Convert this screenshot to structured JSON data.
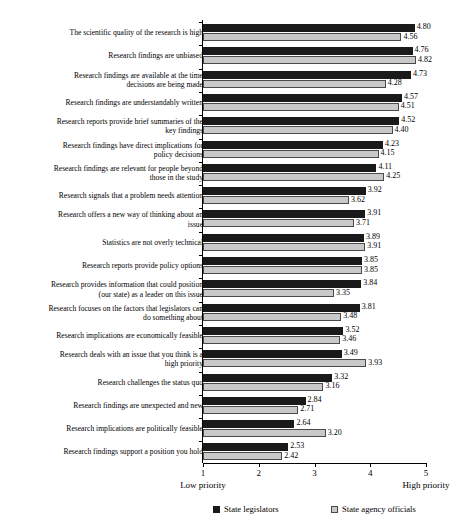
{
  "chart_data": {
    "type": "bar",
    "orientation": "horizontal",
    "title": "",
    "xlabel": "",
    "ylabel": "",
    "xlim": [
      1,
      5
    ],
    "xticks": [
      "1",
      "2",
      "3",
      "4",
      "5"
    ],
    "axis_low_label": "Low\npriority",
    "axis_high_label": "High\npriority",
    "grid": false,
    "legend_position": "bottom",
    "colors": {
      "state_legislators": "#1a1a1a",
      "state_agency_officials": "#c9c9c9",
      "axis": "#000000",
      "background": "#ffffff"
    },
    "categories": [
      "The scientific quality of the research is high",
      "Research findings are unbiased",
      "Research findings are available at the time\ndecisions are being made",
      "Research findings are understandably written",
      "Research reports provide brief summaries of the\nkey findings",
      "Research findings have direct implications for\npolicy decisions",
      "Research findings are relevant for people beyond\nthose in the study",
      "Research signals that a problem needs attention",
      "Research offers a new way of thinking about an\nissue",
      "Statistics are not overly technical",
      "Research reports provide policy options",
      "Research provides information that could position\n(our state) as a leader on this issue",
      "Research focuses on the factors that legislators can\ndo something about",
      "Research implications are economically feasible",
      "Research deals with an issue that you think is a\nhigh priority",
      "Research challenges the status quo",
      "Research findings are unexpected and new",
      "Research implications are politically feasible",
      "Research findings support a position you hold"
    ],
    "series": [
      {
        "name": "State legislators",
        "values": [
          4.8,
          4.76,
          4.73,
          4.57,
          4.52,
          4.23,
          4.11,
          3.92,
          3.91,
          3.89,
          3.85,
          3.84,
          3.81,
          3.52,
          3.49,
          3.32,
          2.84,
          2.64,
          2.53
        ]
      },
      {
        "name": "State agency officials",
        "values": [
          4.56,
          4.82,
          4.28,
          4.51,
          4.4,
          4.15,
          4.25,
          3.62,
          3.71,
          3.91,
          3.85,
          3.35,
          3.48,
          3.46,
          3.93,
          3.16,
          2.71,
          3.2,
          2.42
        ]
      }
    ],
    "value_labels": [
      [
        "4.80",
        "4.56"
      ],
      [
        "4.76",
        "4.82"
      ],
      [
        "4.73",
        "4.28"
      ],
      [
        "4.57",
        "4.51"
      ],
      [
        "4.52",
        "4.40"
      ],
      [
        "4.23",
        "4.15"
      ],
      [
        "4.11",
        "4.25"
      ],
      [
        "3.92",
        "3.62"
      ],
      [
        "3.91",
        "3.71"
      ],
      [
        "3.89",
        "3.91"
      ],
      [
        "3.85",
        "3.85"
      ],
      [
        "3.84",
        "3.35"
      ],
      [
        "3.81",
        "3.48"
      ],
      [
        "3.52",
        "3.46"
      ],
      [
        "3.49",
        "3.93"
      ],
      [
        "3.32",
        "3.16"
      ],
      [
        "2.84",
        "2.71"
      ],
      [
        "2.64",
        "3.20"
      ],
      [
        "2.53",
        "2.42"
      ]
    ]
  },
  "legend": {
    "items": [
      {
        "label": "State legislators",
        "swatch": "dark"
      },
      {
        "label": "State agency officials",
        "swatch": "light"
      }
    ]
  }
}
